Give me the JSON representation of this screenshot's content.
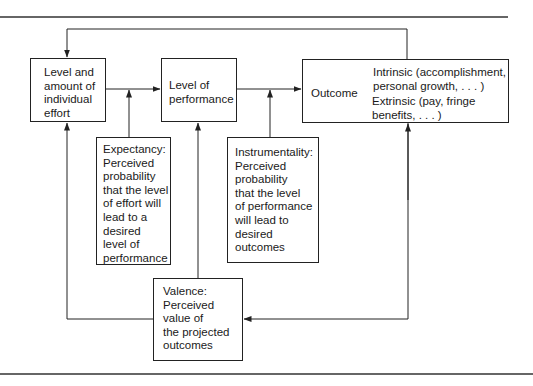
{
  "diagram": {
    "type": "flowchart",
    "title_visible": false,
    "nodes": {
      "effort": {
        "label": "Level and\namount of\nindividual\neffort"
      },
      "performance": {
        "label": "Level of\nperformance"
      },
      "outcome": {
        "label": "Outcome",
        "intrinsic": "Intrinsic (accomplishment,\npersonal growth, . . . )",
        "extrinsic": "Extrinsic (pay, fringe\nbenefits, . . . )"
      },
      "expectancy": {
        "label": "Expectancy:\nPerceived\nprobability\nthat the level\nof effort will\nlead to a\ndesired\nlevel of\nperformance"
      },
      "instrumentality": {
        "label": "Instrumentality:\nPerceived\nprobability\nthat the level\nof performance\nwill lead to\ndesired\noutcomes"
      },
      "valence": {
        "label": "Valence:\nPerceived\nvalue of\nthe projected\noutcomes"
      }
    },
    "edges": [
      {
        "from": "effort",
        "to": "performance"
      },
      {
        "from": "performance",
        "to": "outcome"
      },
      {
        "from": "outcome",
        "to": "effort",
        "note": "feedback loop over top"
      },
      {
        "from": "expectancy",
        "to": "effort-performance link"
      },
      {
        "from": "instrumentality",
        "to": "performance-outcome link"
      },
      {
        "from": "valence",
        "to": "effort"
      },
      {
        "from": "valence",
        "to": "performance"
      },
      {
        "from": "outcome",
        "to": "valence"
      },
      {
        "from": "valence",
        "to": "outcome"
      },
      {
        "from": "outcome-label",
        "to": "intrinsic"
      },
      {
        "from": "outcome-label",
        "to": "extrinsic"
      }
    ],
    "colors": {
      "line": "#222222",
      "background": "#ffffff"
    }
  }
}
